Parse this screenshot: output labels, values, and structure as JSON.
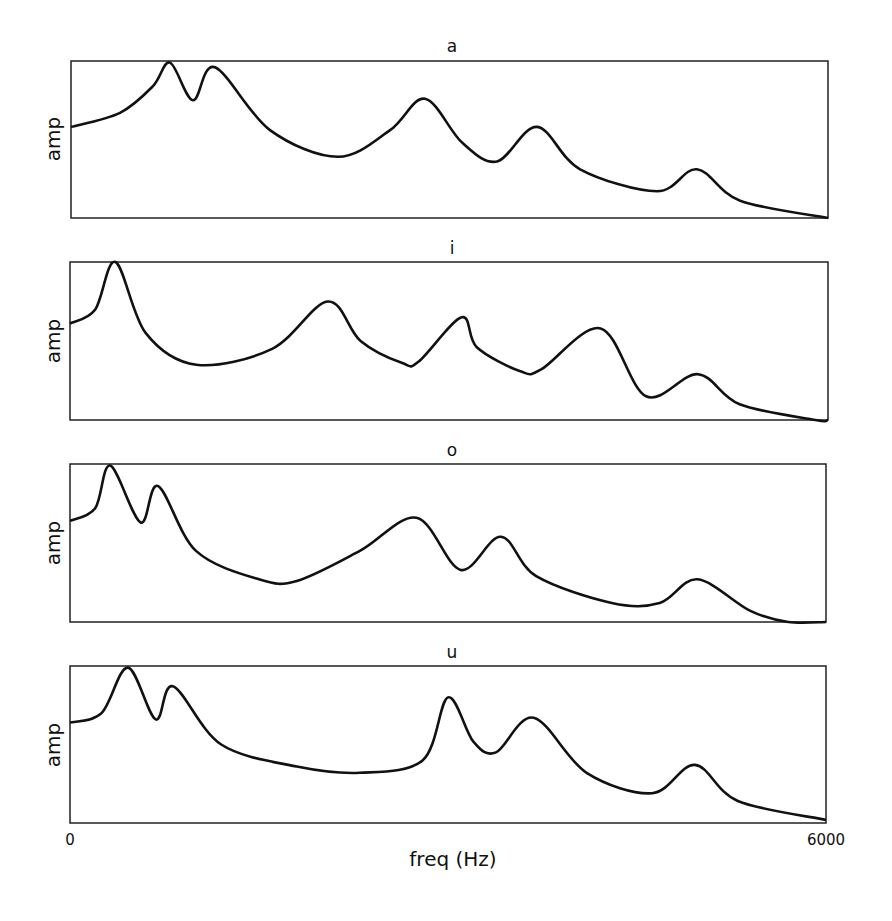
{
  "figure": {
    "xlabel": "freq (Hz)",
    "ylabel": "amp",
    "x_tick_min_label": "0",
    "x_tick_max_label": "6000"
  },
  "colors": {
    "line": "#111111",
    "axes": "#222222",
    "background": "#ffffff"
  },
  "chart_data": [
    {
      "type": "line",
      "title": "a",
      "xlabel": "",
      "ylabel": "amp",
      "xlim": [
        0,
        6000
      ],
      "ylim": [
        0,
        1
      ],
      "grid": false,
      "x": [
        0,
        388,
        650,
        785,
        967,
        1141,
        1577,
        2116,
        2529,
        2806,
        3100,
        3377,
        3694,
        4035,
        4645,
        4962,
        5303,
        6000
      ],
      "values": [
        0.58,
        0.67,
        0.84,
        0.99,
        0.75,
        0.96,
        0.56,
        0.39,
        0.56,
        0.76,
        0.48,
        0.36,
        0.58,
        0.31,
        0.17,
        0.31,
        0.11,
        0.0
      ]
    },
    {
      "type": "line",
      "title": "i",
      "xlabel": "",
      "ylabel": "amp",
      "xlim": [
        0,
        6000
      ],
      "ylim": [
        0,
        1
      ],
      "grid": false,
      "x": [
        0,
        200,
        360,
        600,
        1000,
        1600,
        2040,
        2300,
        2630,
        2760,
        3100,
        3220,
        3560,
        3730,
        4200,
        4560,
        4970,
        5300,
        5900,
        6000
      ],
      "values": [
        0.61,
        0.7,
        1.0,
        0.55,
        0.35,
        0.45,
        0.75,
        0.5,
        0.36,
        0.37,
        0.65,
        0.46,
        0.31,
        0.32,
        0.58,
        0.15,
        0.29,
        0.1,
        0.0,
        0.0
      ]
    },
    {
      "type": "line",
      "title": "o",
      "xlabel": "",
      "ylabel": "amp",
      "xlim": [
        0,
        6000
      ],
      "ylim": [
        0,
        1
      ],
      "grid": false,
      "x": [
        0,
        200,
        320,
        560,
        700,
        1000,
        1500,
        1800,
        2300,
        2750,
        3100,
        3420,
        3700,
        4300,
        4680,
        4980,
        5400,
        5700,
        6000
      ],
      "values": [
        0.64,
        0.72,
        0.99,
        0.63,
        0.86,
        0.45,
        0.27,
        0.26,
        0.45,
        0.66,
        0.33,
        0.54,
        0.29,
        0.12,
        0.12,
        0.27,
        0.07,
        0.0,
        0.0
      ]
    },
    {
      "type": "line",
      "title": "u",
      "xlabel": "freq (Hz)",
      "ylabel": "amp",
      "xlim": [
        0,
        6000
      ],
      "ylim": [
        0,
        1
      ],
      "grid": false,
      "x": [
        0,
        250,
        460,
        680,
        820,
        1200,
        1800,
        2300,
        2800,
        3000,
        3200,
        3380,
        3680,
        4100,
        4620,
        4960,
        5300,
        6000
      ],
      "values": [
        0.64,
        0.7,
        0.99,
        0.66,
        0.87,
        0.5,
        0.36,
        0.32,
        0.4,
        0.8,
        0.52,
        0.45,
        0.67,
        0.32,
        0.19,
        0.37,
        0.14,
        0.02
      ]
    }
  ]
}
